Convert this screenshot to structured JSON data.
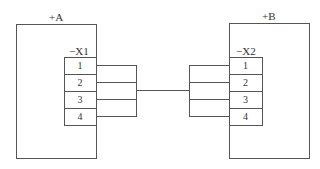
{
  "diagram": {
    "type": "wiring-connection",
    "units": [
      {
        "id": "A",
        "label": "+A",
        "connector": {
          "label": "−X1",
          "pins": [
            "1",
            "2",
            "3",
            "4"
          ]
        }
      },
      {
        "id": "B",
        "label": "+B",
        "connector": {
          "label": "−X2",
          "pins": [
            "1",
            "2",
            "3",
            "4"
          ]
        }
      }
    ],
    "connection": {
      "from": "X1:1-4",
      "to": "X2:1-4",
      "style": "bus"
    },
    "colors": {
      "line": "#555555",
      "text": "#333333",
      "background": "#ffffff"
    }
  }
}
